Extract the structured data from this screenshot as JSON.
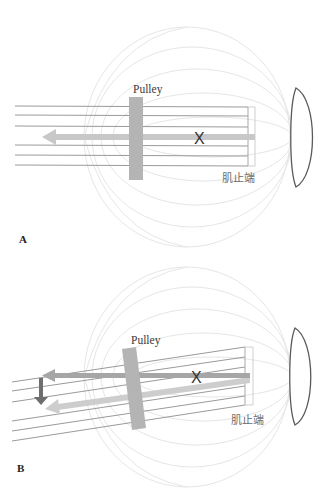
{
  "figure": {
    "panels": [
      {
        "id": "A",
        "letter": "A",
        "pulley_label": "Pulley",
        "insertion_label": "肌止端",
        "center_marker": "X",
        "arrows": [
          {
            "name": "muscle-force-arrow",
            "direction": "left",
            "color": "#c8c8c8"
          }
        ]
      },
      {
        "id": "B",
        "letter": "B",
        "pulley_label": "Pulley",
        "insertion_label": "肌止端",
        "center_marker": "X",
        "arrows": [
          {
            "name": "original-force-arrow",
            "direction": "left",
            "color": "#a6a6a6"
          },
          {
            "name": "shifted-force-arrow",
            "direction": "left-down",
            "color": "#cdcdcd"
          },
          {
            "name": "displacement-arrow",
            "direction": "down",
            "color": "#6e6e6e"
          }
        ]
      }
    ],
    "colors": {
      "globe_lines": "#e6e6e6",
      "muscle_lines": "#9a9a9a",
      "pulley": "#b4b4b4",
      "lens_outline": "#5a5a5a",
      "arrow_light": "#c8c8c8",
      "arrow_dark": "#6e6e6e"
    }
  }
}
